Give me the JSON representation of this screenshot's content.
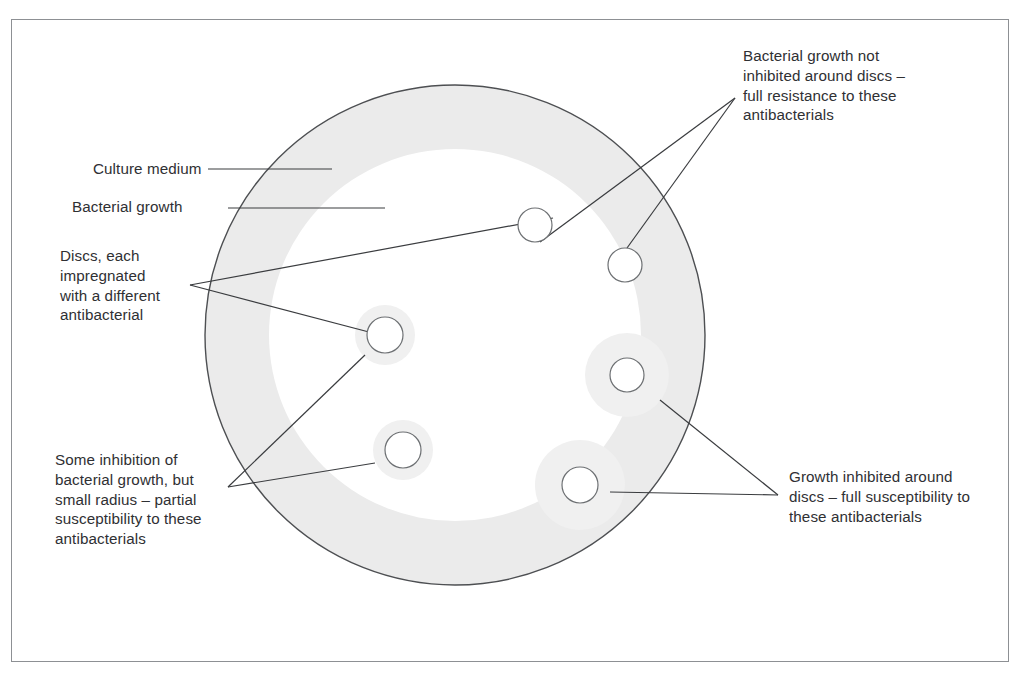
{
  "figure": {
    "kind": "antibiotic-disc-diffusion-diagram",
    "labels": {
      "culture_medium": "Culture medium",
      "bacterial_growth": "Bacterial growth",
      "discs": "Discs, each\nimpregnated\nwith a different\nantibacterial",
      "full_resistance": "Bacterial growth not\ninhibited around discs –\nfull resistance to these\nantibacterials",
      "partial_susceptibility": "Some inhibition of\nbacterial growth, but\nsmall radius – partial\nsusceptibility to these\nantibacterials",
      "full_susceptibility": "Growth inhibited around\ndiscs – full susceptibility to\nthese antibacterials"
    },
    "colors": {
      "frame_border": "#8d9094",
      "dish_outline": "#4d4f52",
      "bacterial_growth_fill": "#ebebeb",
      "inhibition_halo_fill": "#f0f0f0",
      "disc_fill": "#ffffff",
      "disc_outline": "#6d7073",
      "leader_line": "#3a3c3f",
      "text": "#2f3033",
      "page_background": "#ffffff"
    },
    "dish": {
      "center_x": 455,
      "center_y": 335,
      "outer_radius": 250,
      "growth_inner_radius": 186
    },
    "discs": [
      {
        "id": "disc-1",
        "cx": 535,
        "cy": 225,
        "r": 17,
        "halo_r": 0,
        "result": "full resistance"
      },
      {
        "id": "disc-2",
        "cx": 625,
        "cy": 265,
        "r": 17,
        "halo_r": 0,
        "result": "full resistance"
      },
      {
        "id": "disc-3",
        "cx": 385,
        "cy": 335,
        "r": 18,
        "halo_r": 30,
        "result": "partial susceptibility"
      },
      {
        "id": "disc-4",
        "cx": 403,
        "cy": 450,
        "r": 18,
        "halo_r": 30,
        "result": "partial susceptibility"
      },
      {
        "id": "disc-5",
        "cx": 627,
        "cy": 375,
        "r": 17,
        "halo_r": 42,
        "result": "full susceptibility"
      },
      {
        "id": "disc-6",
        "cx": 580,
        "cy": 485,
        "r": 18,
        "halo_r": 45,
        "result": "full susceptibility"
      }
    ],
    "leader_vertices": {
      "discs": {
        "x": 190,
        "y": 285
      },
      "full_resistance": {
        "x": 735,
        "y": 98
      },
      "partial_susceptibility": {
        "x": 228,
        "y": 487
      },
      "full_susceptibility": {
        "x": 778,
        "y": 495
      }
    }
  }
}
